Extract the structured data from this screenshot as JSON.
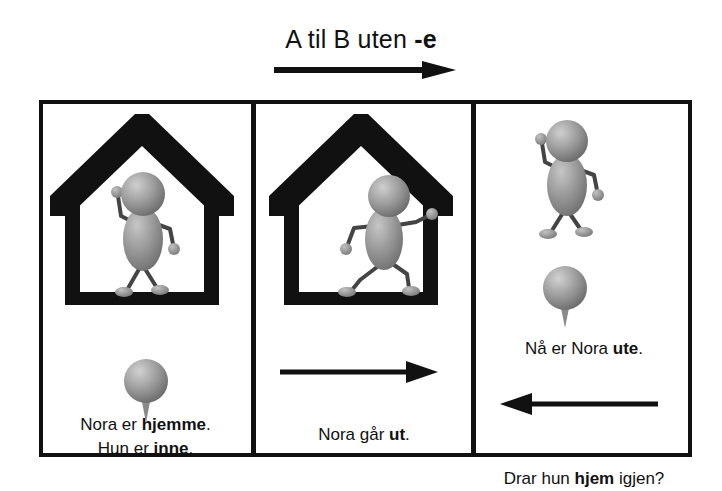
{
  "title": {
    "prefix": "A til B uten ",
    "emphasis": "-e",
    "arrow_icon": "arrow-right-icon"
  },
  "panels": [
    {
      "id": "panel-1",
      "scene_icon": "house-with-person-inside-icon",
      "pin_icon": "map-pin-icon",
      "captions": [
        {
          "before": "Nora er ",
          "bold": "hjemme",
          "after": "."
        },
        {
          "before": "Hun er ",
          "bold": "inne",
          "after": "."
        }
      ]
    },
    {
      "id": "panel-2",
      "scene_icon": "house-with-person-exiting-icon",
      "arrow_icon": "arrow-right-icon",
      "captions": [
        {
          "before": "Nora går ",
          "bold": "ut",
          "after": "."
        }
      ]
    },
    {
      "id": "panel-3",
      "scene_icon": "person-standing-icon",
      "pin_icon": "map-pin-icon",
      "arrow_icon": "arrow-left-icon",
      "captions": [
        {
          "before": "Nå er Nora ",
          "bold": "ute",
          "after": "."
        },
        {
          "before": "Drar hun ",
          "bold": "hjem",
          "after": " igjen?"
        }
      ]
    }
  ],
  "colors": {
    "ink": "#111111",
    "figure_light": "#b9b9b9",
    "figure_mid": "#8d8d8d",
    "figure_dark": "#5e5e5e",
    "background": "#ffffff"
  }
}
